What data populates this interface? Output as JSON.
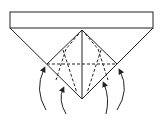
{
  "diagram": {
    "type": "origami-fold-step",
    "stroke_color": "#222222",
    "background": "#ffffff",
    "band": {
      "x": 10,
      "y": 12,
      "w": 143,
      "h": 16
    },
    "triangle": {
      "left": [
        10,
        28
      ],
      "right": [
        153,
        28
      ],
      "apex": [
        82,
        99
      ],
      "top_center": [
        82,
        30
      ]
    },
    "diamond": {
      "left": [
        47,
        64
      ],
      "right": [
        117,
        64
      ]
    },
    "arrows": [
      {
        "name": "arrow-outer-left",
        "from": [
          46,
          110
        ],
        "to": [
          44,
          68
        ]
      },
      {
        "name": "arrow-inner-left",
        "from": [
          66,
          114
        ],
        "to": [
          63,
          89
        ]
      },
      {
        "name": "arrow-inner-right",
        "from": [
          106,
          114
        ],
        "to": [
          104,
          83
        ]
      },
      {
        "name": "arrow-outer-right",
        "from": [
          117,
          110
        ],
        "to": [
          120,
          70
        ]
      }
    ]
  }
}
